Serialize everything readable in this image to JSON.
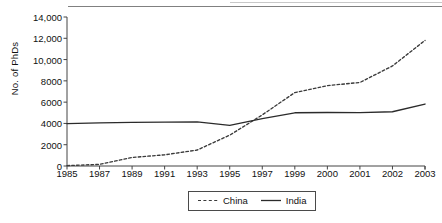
{
  "chart_data": {
    "type": "line",
    "title": "",
    "xlabel": "",
    "ylabel": "No. of PhDs",
    "categories": [
      "1985",
      "1987",
      "1989",
      "1991",
      "1993",
      "1995",
      "1997",
      "1999",
      "2000",
      "2001",
      "2002",
      "2003"
    ],
    "x_tick_labels": [
      "1985",
      "1987",
      "1989",
      "1991",
      "1993",
      "1995",
      "1997",
      "1999",
      "2000",
      "2001",
      "2002",
      "2003"
    ],
    "y_tick_labels": [
      "0",
      "2000",
      "4000",
      "6000",
      "8000",
      "10,000",
      "12,000",
      "14,000"
    ],
    "y_tick_values": [
      0,
      2000,
      4000,
      6000,
      8000,
      10000,
      12000,
      14000
    ],
    "ylim": [
      0,
      14000
    ],
    "grid": false,
    "legend_position": "bottom-center",
    "series": [
      {
        "name": "China",
        "style": "dashed",
        "color": "#3a3a3a",
        "values": [
          40,
          150,
          800,
          1050,
          1500,
          2900,
          4800,
          6900,
          7550,
          7850,
          9400,
          11800
        ]
      },
      {
        "name": "India",
        "style": "solid",
        "color": "#2b2b2b",
        "values": [
          3980,
          4050,
          4100,
          4130,
          4150,
          3820,
          4450,
          5000,
          5030,
          5020,
          5100,
          5820
        ]
      }
    ]
  },
  "legend": {
    "items": [
      {
        "label": "China",
        "style": "dashed"
      },
      {
        "label": "India",
        "style": "solid"
      }
    ]
  },
  "colors": {
    "axis": "#444444",
    "china": "#3a3a3a",
    "india": "#2b2b2b",
    "text": "#111111"
  }
}
